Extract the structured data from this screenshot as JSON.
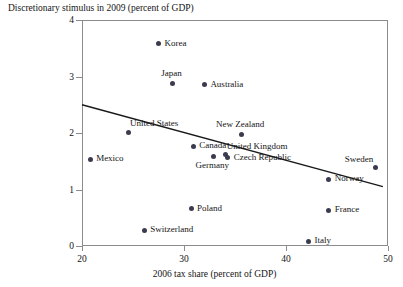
{
  "chart_data": {
    "type": "scatter",
    "title": "Discretionary stimulus in 2009 (percent of GDP)",
    "xlabel": "2006 tax share (percent of GDP)",
    "ylabel": "Discretionary stimulus in 2009 (percent of GDP)",
    "xlim": [
      20,
      50
    ],
    "ylim": [
      0,
      4
    ],
    "xticks": [
      20,
      30,
      40,
      50
    ],
    "yticks": [
      0,
      1,
      2,
      3,
      4
    ],
    "grid": false,
    "legend": null,
    "marker_color": "#3b3b4f",
    "axis_color": "#8c8c8c",
    "points": [
      {
        "label": "Korea",
        "x": 27.4,
        "y": 3.6,
        "label_pos": "right"
      },
      {
        "label": "Japan",
        "x": 28.8,
        "y": 2.9,
        "label_pos": "above"
      },
      {
        "label": "Australia",
        "x": 31.9,
        "y": 2.87,
        "label_pos": "right"
      },
      {
        "label": "United States",
        "x": 24.5,
        "y": 2.03,
        "label_pos": "above-right"
      },
      {
        "label": "New Zealand",
        "x": 35.5,
        "y": 2.0,
        "label_pos": "above"
      },
      {
        "label": "Canada",
        "x": 30.8,
        "y": 1.78,
        "label_pos": "right"
      },
      {
        "label": "United Kingdom",
        "x": 34.0,
        "y": 1.63,
        "label_pos": "above-right"
      },
      {
        "label": "Czech Republic",
        "x": 34.2,
        "y": 1.58,
        "label_pos": "right"
      },
      {
        "label": "Germany",
        "x": 32.8,
        "y": 1.6,
        "label_pos": "below"
      },
      {
        "label": "Mexico",
        "x": 20.7,
        "y": 1.55,
        "label_pos": "right"
      },
      {
        "label": "Sweden",
        "x": 48.7,
        "y": 1.4,
        "label_pos": "above-left"
      },
      {
        "label": "Norway",
        "x": 44.1,
        "y": 1.2,
        "label_pos": "right"
      },
      {
        "label": "Poland",
        "x": 30.6,
        "y": 0.68,
        "label_pos": "right"
      },
      {
        "label": "France",
        "x": 44.1,
        "y": 0.65,
        "label_pos": "right"
      },
      {
        "label": "Switzerland",
        "x": 26.0,
        "y": 0.3,
        "label_pos": "right"
      },
      {
        "label": "Italy",
        "x": 42.1,
        "y": 0.1,
        "label_pos": "right"
      }
    ],
    "trendline": {
      "x0": 20.0,
      "y0": 2.5,
      "x1": 49.5,
      "y1": 1.05,
      "color": "#1a1a1a"
    }
  }
}
